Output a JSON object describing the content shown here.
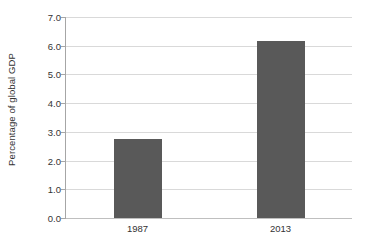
{
  "chart_data": {
    "type": "bar",
    "title": "",
    "subtitle": "",
    "xlabel": "",
    "ylabel": "Percentage of global GDP",
    "categories": [
      "1987",
      "2013"
    ],
    "values": [
      2.75,
      6.15
    ],
    "series": [
      {
        "name": "Percentage of global GDP",
        "values": [
          2.75,
          6.15
        ]
      }
    ],
    "ylim": [
      0.0,
      7.0
    ],
    "ytick_labels": [
      "0.0",
      "1.0",
      "2.0",
      "3.0",
      "4.0",
      "5.0",
      "6.0",
      "7.0"
    ],
    "ytick_values": [
      0.0,
      1.0,
      2.0,
      3.0,
      4.0,
      5.0,
      6.0,
      7.0
    ],
    "grid": "horizontal",
    "legend": "none",
    "bar_color": "#595959",
    "gridline_color": "#d9d9d9",
    "axis_color": "#a6a6a6",
    "background_color": "#ffffff",
    "text_color": "#333333"
  }
}
